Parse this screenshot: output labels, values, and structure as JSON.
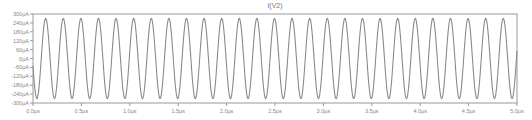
{
  "chart_data": {
    "type": "line",
    "title": "I(V2)",
    "xlabel": "",
    "ylabel": "",
    "xlim": [
      0,
      5.0
    ],
    "ylim": [
      -300,
      300
    ],
    "x_unit": "µs",
    "y_unit": "µA",
    "grid": false,
    "legend": null,
    "x_ticks": [
      "0.0µs",
      "0.5µs",
      "1.0µs",
      "1.5µs",
      "2.0µs",
      "2.5µs",
      "3.0µs",
      "3.5µs",
      "4.0µs",
      "4.5µs",
      "5.0µs"
    ],
    "x_tick_values": [
      0,
      0.5,
      1.0,
      1.5,
      2.0,
      2.5,
      3.0,
      3.5,
      4.0,
      4.5,
      5.0
    ],
    "y_ticks": [
      "300µA",
      "240µA",
      "180µA",
      "120µA",
      "60µA",
      "0µA",
      "-60µA",
      "-120µA",
      "-180µA",
      "-240µA",
      "-300µA"
    ],
    "y_tick_values": [
      300,
      240,
      180,
      120,
      60,
      0,
      -60,
      -120,
      -180,
      -240,
      -300
    ],
    "series": [
      {
        "name": "I(V2)",
        "color": "#8a8a8a",
        "waveform": "sine",
        "amplitude_uA": 270,
        "offset_uA": 0,
        "frequency_MHz": 5.5,
        "period_us": 0.182,
        "phase_rad": -2.953,
        "cycles_visible": 27.5
      }
    ]
  },
  "colors": {
    "background": "#ffffff",
    "axis": "#999999",
    "trace": "#8a8a8a",
    "text": "#888888"
  },
  "layout": {
    "plot_left": 33,
    "plot_right": 517,
    "plot_top": 14,
    "plot_bottom": 103
  }
}
